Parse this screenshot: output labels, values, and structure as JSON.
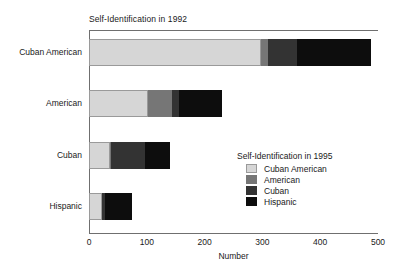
{
  "chart_data": {
    "type": "bar",
    "orientation": "horizontal",
    "stacked": true,
    "title": "Self-Identification in 1992",
    "xlabel": "Number",
    "ylabel": "",
    "xlim": [
      0,
      500
    ],
    "xticks": [
      0,
      100,
      200,
      300,
      400,
      500
    ],
    "xtick_labels": [
      "0",
      "100",
      "200",
      "300",
      "400",
      "500"
    ],
    "grid": false,
    "legend_title": "Self-Identification in 1995",
    "legend_position": "inside-lower-right",
    "categories": [
      "Cuban American",
      "American",
      "Cuban",
      "Hispanic"
    ],
    "series": [
      {
        "name": "Cuban American",
        "color": "#d6d6d6",
        "values": [
          298,
          102,
          36,
          22
        ]
      },
      {
        "name": "American",
        "color": "#767676",
        "values": [
          12,
          42,
          2,
          0
        ]
      },
      {
        "name": "Cuban",
        "color": "#333333",
        "values": [
          50,
          12,
          59,
          6
        ]
      },
      {
        "name": "Hispanic",
        "color": "#0d0d0d",
        "values": [
          128,
          74,
          43,
          46
        ]
      }
    ],
    "totals": [
      488,
      230,
      140,
      74
    ]
  }
}
